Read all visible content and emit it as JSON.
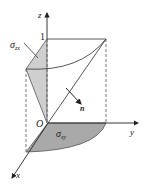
{
  "diagram": {
    "axes": {
      "z": "z",
      "y": "y",
      "x": "x",
      "origin": "O"
    },
    "tick_one": "1",
    "sigma_zx": {
      "symbol": "σ",
      "sub": "zx"
    },
    "sigma_xy": {
      "symbol": "σ",
      "sub": "xy"
    },
    "normal": "n",
    "colors": {
      "shade": "#c8c8c8",
      "shade_dark": "#a8a8a8",
      "line": "#444444"
    }
  }
}
